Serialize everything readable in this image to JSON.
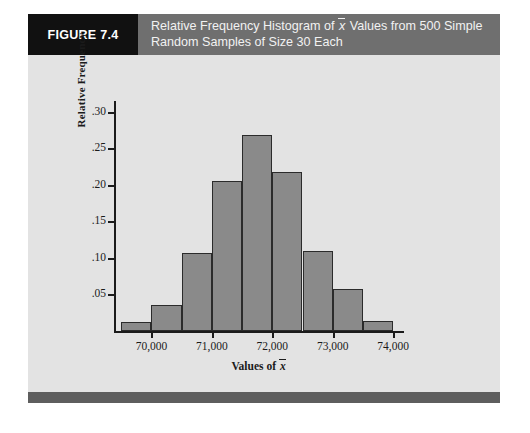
{
  "figure": {
    "number_label": "FIGURE 7.4",
    "title_line1_pre": "Relative Frequency Histogram of ",
    "title_line1_var": "x",
    "title_line1_post": " Values from 500 Simple",
    "title_line2": "Random Samples of Size 30 Each",
    "header_bg": "#6f6f6f",
    "number_tab_bg": "#111111",
    "panel_bg": "#e3e3e3",
    "footer_bg": "#5e5e5e"
  },
  "chart_data": {
    "type": "bar",
    "subtype": "histogram",
    "xlabel_pre": "Values of ",
    "xlabel_var": "x",
    "ylabel": "Relative Frequency",
    "bar_color": "#8a8a8a",
    "bar_border_color": "#2b2b2b",
    "grid": false,
    "legend": null,
    "xlim": [
      69380,
      74180
    ],
    "ylim": [
      0,
      0.315
    ],
    "bin_width": 500,
    "x_ticks": [
      70000,
      71000,
      72000,
      73000,
      74000
    ],
    "x_tick_labels": [
      "70,000",
      "71,000",
      "72,000",
      "73,000",
      "74,000"
    ],
    "y_ticks": [
      0.05,
      0.1,
      0.15,
      0.2,
      0.25,
      0.3
    ],
    "y_tick_labels": [
      ".05",
      ".10",
      ".15",
      ".20",
      ".25",
      ".30"
    ],
    "bins": [
      {
        "left": 69500,
        "right": 70000,
        "value": 0.012
      },
      {
        "left": 70000,
        "right": 70500,
        "value": 0.036
      },
      {
        "left": 70500,
        "right": 71000,
        "value": 0.107
      },
      {
        "left": 71000,
        "right": 71500,
        "value": 0.205
      },
      {
        "left": 71500,
        "right": 72000,
        "value": 0.268
      },
      {
        "left": 72000,
        "right": 72500,
        "value": 0.218
      },
      {
        "left": 72500,
        "right": 73000,
        "value": 0.11
      },
      {
        "left": 73000,
        "right": 73500,
        "value": 0.058
      },
      {
        "left": 73500,
        "right": 74000,
        "value": 0.014
      }
    ],
    "categories": [
      "69,500-70,000",
      "70,000-70,500",
      "70,500-71,000",
      "71,000-71,500",
      "71,500-72,000",
      "72,000-72,500",
      "72,500-73,000",
      "73,000-73,500",
      "73,500-74,000"
    ],
    "values": [
      0.012,
      0.036,
      0.107,
      0.205,
      0.268,
      0.218,
      0.11,
      0.058,
      0.014
    ]
  }
}
